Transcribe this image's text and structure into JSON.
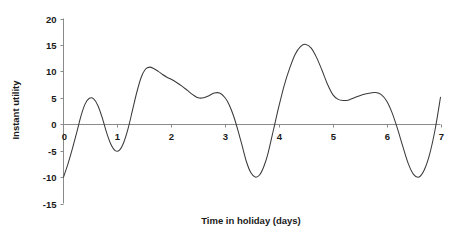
{
  "chart_data": {
    "type": "line",
    "title": "",
    "xlabel": "Time in holiday (days)",
    "ylabel": "Instant utility",
    "xlim": [
      0,
      7
    ],
    "ylim": [
      -15,
      20
    ],
    "x_ticks": [
      "0",
      "1",
      "2",
      "3",
      "4",
      "5",
      "6",
      "7"
    ],
    "y_ticks": [
      "20",
      "15",
      "10",
      "5",
      "0",
      "-5",
      "-10",
      "-15"
    ],
    "grid": false,
    "legend": "none",
    "series": [
      {
        "name": "Instant utility",
        "color": "#3a3a3a",
        "x": [
          0.0,
          0.08,
          0.16,
          0.24,
          0.32,
          0.4,
          0.48,
          0.56,
          0.64,
          0.72,
          0.8,
          0.88,
          0.96,
          1.04,
          1.12,
          1.2,
          1.28,
          1.36,
          1.44,
          1.52,
          1.6,
          1.68,
          1.76,
          1.84,
          1.92,
          2.0,
          2.1,
          2.2,
          2.3,
          2.4,
          2.5,
          2.6,
          2.7,
          2.8,
          2.9,
          3.0,
          3.08,
          3.16,
          3.24,
          3.32,
          3.4,
          3.48,
          3.56,
          3.64,
          3.72,
          3.8,
          3.9,
          4.0,
          4.1,
          4.2,
          4.3,
          4.4,
          4.5,
          4.6,
          4.7,
          4.8,
          4.9,
          5.0,
          5.1,
          5.2,
          5.3,
          5.4,
          5.5,
          5.6,
          5.7,
          5.8,
          5.9,
          6.0,
          6.1,
          6.2,
          6.3,
          6.4,
          6.5,
          6.6,
          6.7,
          6.8,
          6.9,
          7.0
        ],
        "y": [
          -10.0,
          -7.6,
          -4.8,
          -1.8,
          1.4,
          3.8,
          4.9,
          4.8,
          3.5,
          1.2,
          -1.6,
          -3.8,
          -5.0,
          -4.9,
          -3.4,
          -0.8,
          2.6,
          6.0,
          8.8,
          10.4,
          10.8,
          10.5,
          10.0,
          9.4,
          8.9,
          8.5,
          7.9,
          7.2,
          6.4,
          5.6,
          5.0,
          5.0,
          5.4,
          5.9,
          5.9,
          5.0,
          3.6,
          1.5,
          -1.2,
          -4.2,
          -7.2,
          -9.2,
          -10.0,
          -9.6,
          -8.0,
          -5.4,
          -1.0,
          3.4,
          7.4,
          10.6,
          13.2,
          14.7,
          15.1,
          14.4,
          12.6,
          10.2,
          7.6,
          5.6,
          4.7,
          4.5,
          4.6,
          5.0,
          5.4,
          5.7,
          5.9,
          6.0,
          5.6,
          4.4,
          2.2,
          -0.8,
          -4.2,
          -7.4,
          -9.5,
          -10.0,
          -8.6,
          -5.6,
          -1.0,
          5.1
        ]
      }
    ]
  },
  "axes": {
    "y_axis_label": "Instant utility",
    "x_axis_label": "Time in holiday (days)"
  }
}
